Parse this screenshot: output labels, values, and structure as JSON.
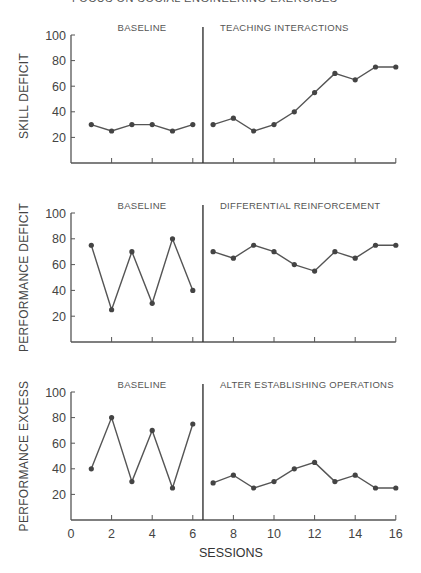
{
  "header": {
    "text": "FOCUS ON SOCIAL ENGINEERING EXERCISES"
  },
  "chart_data": [
    {
      "type": "line",
      "title": "",
      "ylabel": "SKILL DEFICIT",
      "xlabel": "",
      "ylim": [
        0,
        100
      ],
      "yticks": [
        20,
        40,
        60,
        80,
        100
      ],
      "phases": [
        {
          "label": "BASELINE",
          "x": [
            1,
            2,
            3,
            4,
            5,
            6
          ],
          "values": [
            30,
            25,
            30,
            30,
            25,
            30
          ]
        },
        {
          "label": "TEACHING INTERACTIONS",
          "x": [
            7,
            8,
            9,
            10,
            11,
            12,
            13,
            14,
            15,
            16
          ],
          "values": [
            30,
            35,
            25,
            30,
            40,
            55,
            70,
            65,
            75,
            75
          ]
        }
      ],
      "phase_change_line": 6.5
    },
    {
      "type": "line",
      "title": "",
      "ylabel": "PERFORMANCE DEFICIT",
      "xlabel": "",
      "ylim": [
        0,
        100
      ],
      "yticks": [
        20,
        40,
        60,
        80,
        100
      ],
      "phases": [
        {
          "label": "BASELINE",
          "x": [
            1,
            2,
            3,
            4,
            5,
            6
          ],
          "values": [
            75,
            25,
            70,
            30,
            80,
            40
          ]
        },
        {
          "label": "DIFFERENTIAL REINFORCEMENT",
          "x": [
            7,
            8,
            9,
            10,
            11,
            12,
            13,
            14,
            15,
            16
          ],
          "values": [
            70,
            65,
            75,
            70,
            60,
            55,
            70,
            65,
            75,
            75
          ]
        }
      ],
      "phase_change_line": 6.5
    },
    {
      "type": "line",
      "title": "",
      "ylabel": "PERFORMANCE EXCESS",
      "xlabel": "SESSIONS",
      "ylim": [
        0,
        100
      ],
      "xlim": [
        0,
        16
      ],
      "xticks": [
        0,
        2,
        4,
        6,
        8,
        10,
        12,
        14,
        16
      ],
      "yticks": [
        20,
        40,
        60,
        80,
        100
      ],
      "phases": [
        {
          "label": "BASELINE",
          "x": [
            1,
            2,
            3,
            4,
            5,
            6
          ],
          "values": [
            40,
            80,
            30,
            70,
            25,
            75
          ]
        },
        {
          "label": "ALTER ESTABLISHING OPERATIONS",
          "x": [
            7,
            8,
            9,
            10,
            11,
            12,
            13,
            14,
            15,
            16
          ],
          "values": [
            29,
            35,
            25,
            30,
            40,
            45,
            30,
            35,
            25,
            25
          ]
        }
      ],
      "phase_change_line": 6.5
    }
  ],
  "colors": {
    "line": "#555555",
    "marker": "#444444",
    "axis": "#555555"
  }
}
